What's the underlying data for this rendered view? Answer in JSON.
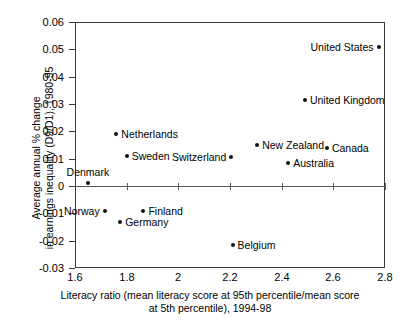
{
  "chart_data": {
    "type": "scatter",
    "title": "",
    "xlabel_lines": [
      "Literacy ratio (mean literacy score at 95th percentile/mean score",
      "at 5th percentile), 1994-98"
    ],
    "ylabel_lines": [
      "Average annual % change",
      "in earnings inequality (D9/D1), 1980-95"
    ],
    "xlim": [
      1.6,
      2.8
    ],
    "ylim": [
      -0.03,
      0.06
    ],
    "xticks": [
      "1.6",
      "1.8",
      "2",
      "2.2",
      "2.4",
      "2.6",
      "2.8"
    ],
    "xtick_values": [
      1.6,
      1.8,
      2.0,
      2.2,
      2.4,
      2.6,
      2.8
    ],
    "yticks": [
      "0.06",
      "0.05",
      "0.04",
      "0.03",
      "0.02",
      "0.01",
      "0",
      "-0.01",
      "-0.02",
      "-0.03"
    ],
    "ytick_values": [
      0.06,
      0.05,
      0.04,
      0.03,
      0.02,
      0.01,
      0,
      -0.01,
      -0.02,
      -0.03
    ],
    "grid": false,
    "legend": "none",
    "marker_color": "#111111",
    "axis_color": "#3b3b3b",
    "points": [
      {
        "label": "United States",
        "x": 2.775,
        "y": 0.051,
        "label_pos": "left"
      },
      {
        "label": "United Kingdom",
        "x": 2.49,
        "y": 0.0315,
        "label_pos": "right"
      },
      {
        "label": "Canada",
        "x": 2.575,
        "y": 0.014,
        "label_pos": "right"
      },
      {
        "label": "New Zealand",
        "x": 2.305,
        "y": 0.015,
        "label_pos": "right"
      },
      {
        "label": "Australia",
        "x": 2.425,
        "y": 0.0085,
        "label_pos": "right"
      },
      {
        "label": "Switzerland",
        "x": 2.205,
        "y": 0.0105,
        "label_pos": "left"
      },
      {
        "label": "Netherlands",
        "x": 1.76,
        "y": 0.019,
        "label_pos": "right"
      },
      {
        "label": "Sweden",
        "x": 1.8,
        "y": 0.011,
        "label_pos": "right"
      },
      {
        "label": "Denmark",
        "x": 1.65,
        "y": 0.001,
        "label_pos": "above"
      },
      {
        "label": "Norway",
        "x": 1.715,
        "y": -0.009,
        "label_pos": "left"
      },
      {
        "label": "Finland",
        "x": 1.865,
        "y": -0.009,
        "label_pos": "right"
      },
      {
        "label": "Germany",
        "x": 1.775,
        "y": -0.013,
        "label_pos": "right"
      },
      {
        "label": "Belgium",
        "x": 2.21,
        "y": -0.0215,
        "label_pos": "right"
      }
    ]
  }
}
